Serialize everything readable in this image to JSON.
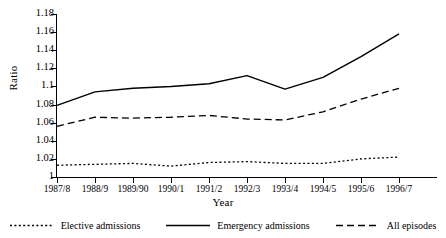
{
  "chart_data": {
    "type": "line",
    "title": "",
    "xlabel": "Year",
    "ylabel": "Ratio",
    "categories": [
      "1987/8",
      "1988/9",
      "1989/90",
      "1990/1",
      "1991/2",
      "1992/3",
      "1993/4",
      "1994/5",
      "1995/6",
      "1996/7"
    ],
    "ylim": [
      1,
      1.18
    ],
    "yticks": [
      1,
      1.02,
      1.04,
      1.06,
      1.08,
      1.1,
      1.12,
      1.14,
      1.16,
      1.18
    ],
    "ytick_labels": [
      "1",
      "1.02",
      "1.04",
      "1.06",
      "1.08",
      "1.1",
      "1.12",
      "1.14",
      "1.16",
      "1.18"
    ],
    "grid": false,
    "legend_position": "below",
    "series": [
      {
        "name": "Elective admissions",
        "style": "dotted",
        "color": "#000000",
        "values": [
          1.013,
          1.014,
          1.015,
          1.012,
          1.016,
          1.017,
          1.015,
          1.015,
          1.02,
          1.022
        ]
      },
      {
        "name": "Emergency admissions",
        "style": "solid",
        "color": "#000000",
        "values": [
          1.079,
          1.094,
          1.098,
          1.1,
          1.103,
          1.112,
          1.097,
          1.11,
          1.133,
          1.158
        ]
      },
      {
        "name": "All episodes",
        "style": "dashed",
        "color": "#000000",
        "values": [
          1.056,
          1.066,
          1.065,
          1.066,
          1.068,
          1.064,
          1.063,
          1.072,
          1.086,
          1.098
        ]
      }
    ]
  },
  "legend": {
    "items": [
      {
        "label": "Elective admissions",
        "icon": "dotted-line-icon"
      },
      {
        "label": "Emergency admissions",
        "icon": "solid-line-icon"
      },
      {
        "label": "All episodes",
        "icon": "dashed-line-icon"
      }
    ]
  }
}
